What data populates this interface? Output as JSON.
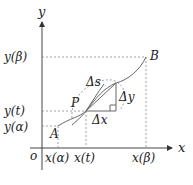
{
  "diagram": {
    "axes": {
      "x_label": "x",
      "y_label": "y",
      "origin_label": "o"
    },
    "y_ticks": [
      "y(β)",
      "y(t)",
      "y(α)"
    ],
    "x_ticks": [
      "x(α)",
      "x(t)",
      "x(β)"
    ],
    "points": {
      "start": "A",
      "current": "P",
      "end": "B"
    },
    "increments": {
      "arc": "Δs",
      "dx": "Δx",
      "dy": "Δy"
    },
    "colors": {
      "axis": "#444444",
      "curve": "#666666",
      "guide": "#888888",
      "text": "#222222"
    }
  }
}
